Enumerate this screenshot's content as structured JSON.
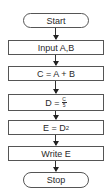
{
  "flowchart": {
    "start": "Start",
    "steps": [
      {
        "label": "Input A,B"
      },
      {
        "label": "C = A + B"
      },
      {
        "label": "D = ",
        "frac_num": "C",
        "frac_den": "5"
      },
      {
        "label": "E = D",
        "sup": "2"
      },
      {
        "label": "Write E"
      }
    ],
    "stop": "Stop"
  }
}
